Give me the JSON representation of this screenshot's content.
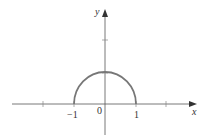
{
  "diagram": {
    "type": "function-graph",
    "axes": {
      "x_label": "x",
      "y_label": "y"
    },
    "tick_labels": {
      "neg_one": "−1",
      "zero": "0",
      "one": "1"
    },
    "curve": {
      "shape": "upper-semicircle",
      "center": [
        0,
        0
      ],
      "radius": 1,
      "x_range": [
        -1,
        1
      ],
      "color": "#777777"
    },
    "colors": {
      "axis": "#555555",
      "curve": "#777777",
      "text": "#333333"
    }
  }
}
